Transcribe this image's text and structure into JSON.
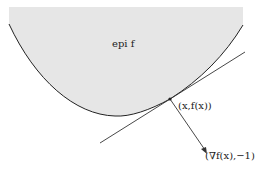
{
  "diagram": {
    "region_label": "epi f",
    "point_label": "(x,f(x))",
    "vector_label": "(∇f(x),−1)",
    "colors": {
      "region_fill": "#e6e6e6",
      "curve": "#222222",
      "line": "#333333"
    }
  }
}
